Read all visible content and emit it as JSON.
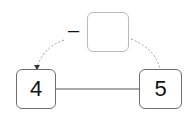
{
  "diagram": {
    "left_value": "4",
    "right_value": "5",
    "answer_value": "",
    "operator": "–",
    "colors": {
      "box_border": "#6e6e6e",
      "blank_border": "#b9b9b9",
      "arrow": "#a0a0a0",
      "line": "#555555"
    }
  }
}
